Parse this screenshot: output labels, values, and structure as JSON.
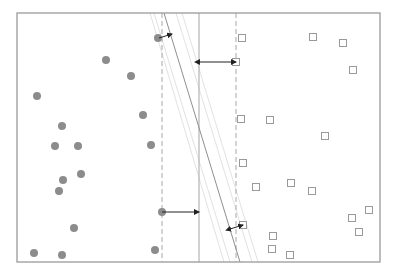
{
  "diagram": {
    "type": "svm-margin-illustration",
    "frame": {
      "x1": 17,
      "y1": 13,
      "x2": 380,
      "y2": 262,
      "color": "#9a9a9a"
    },
    "colors": {
      "circle_fill": "#8c8c8c",
      "square_stroke": "#9a9a9a",
      "dashed": "#a8a8a8",
      "solid_vertical": "#b4b4b4",
      "diagonal": "#8f8f8f",
      "faint_diagonal": "#e2e2e2",
      "arrow": "#222222"
    },
    "lines": {
      "dashed_left": {
        "x": 162,
        "y1": 13,
        "y2": 262
      },
      "dashed_right": {
        "x": 236,
        "y1": 13,
        "y2": 262
      },
      "solid_vertical": {
        "x": 199,
        "y1": 13,
        "y2": 262
      },
      "diagonal_main": {
        "x1": 164,
        "y1": 13,
        "x2": 240,
        "y2": 262
      },
      "diagonal_faint": [
        {
          "x1": 150,
          "y1": 13,
          "x2": 224,
          "y2": 262
        },
        {
          "x1": 154,
          "y1": 13,
          "x2": 230,
          "y2": 262
        },
        {
          "x1": 176,
          "y1": 13,
          "x2": 252,
          "y2": 262
        },
        {
          "x1": 182,
          "y1": 13,
          "x2": 258,
          "y2": 262
        }
      ]
    },
    "arrows": [
      {
        "name": "top-left-margin-arrow",
        "x1": 159,
        "y1": 38,
        "x2": 172,
        "y2": 34,
        "double": false
      },
      {
        "name": "top-right-margin-arrow",
        "x1": 199,
        "y1": 62,
        "x2": 236,
        "y2": 62,
        "double": true
      },
      {
        "name": "bottom-left-margin-arrow",
        "x1": 162,
        "y1": 212,
        "x2": 199,
        "y2": 212,
        "double": false
      },
      {
        "name": "bottom-right-margin-arrow",
        "x1": 230,
        "y1": 229,
        "x2": 243,
        "y2": 225,
        "double": true
      }
    ],
    "circles": [
      {
        "x": 158,
        "y": 38
      },
      {
        "x": 106,
        "y": 60
      },
      {
        "x": 131,
        "y": 76
      },
      {
        "x": 37,
        "y": 96
      },
      {
        "x": 143,
        "y": 115
      },
      {
        "x": 62,
        "y": 126
      },
      {
        "x": 55,
        "y": 146
      },
      {
        "x": 78,
        "y": 146
      },
      {
        "x": 151,
        "y": 145
      },
      {
        "x": 81,
        "y": 174
      },
      {
        "x": 63,
        "y": 180
      },
      {
        "x": 59,
        "y": 191
      },
      {
        "x": 162,
        "y": 212
      },
      {
        "x": 74,
        "y": 228
      },
      {
        "x": 155,
        "y": 250
      },
      {
        "x": 34,
        "y": 253
      },
      {
        "x": 62,
        "y": 255
      }
    ],
    "circle_radius": 4,
    "squares": [
      {
        "x": 242,
        "y": 38
      },
      {
        "x": 313,
        "y": 37
      },
      {
        "x": 343,
        "y": 43
      },
      {
        "x": 236,
        "y": 62
      },
      {
        "x": 353,
        "y": 70
      },
      {
        "x": 241,
        "y": 119
      },
      {
        "x": 270,
        "y": 120
      },
      {
        "x": 325,
        "y": 136
      },
      {
        "x": 243,
        "y": 163
      },
      {
        "x": 256,
        "y": 187
      },
      {
        "x": 291,
        "y": 183
      },
      {
        "x": 312,
        "y": 191
      },
      {
        "x": 369,
        "y": 210
      },
      {
        "x": 352,
        "y": 218
      },
      {
        "x": 243,
        "y": 225
      },
      {
        "x": 273,
        "y": 236
      },
      {
        "x": 359,
        "y": 232
      },
      {
        "x": 272,
        "y": 249
      },
      {
        "x": 290,
        "y": 255
      }
    ],
    "square_size": 7
  }
}
